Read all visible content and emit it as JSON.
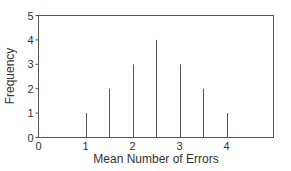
{
  "chart_data": {
    "type": "bar",
    "style": "spike/line bars",
    "title": "",
    "xlabel": "Mean Number of Errors",
    "ylabel": "Frequency",
    "x": [
      1,
      1.5,
      2,
      2.5,
      3,
      3.5,
      4
    ],
    "values": [
      1,
      2,
      3,
      4,
      3,
      2,
      1
    ],
    "xlim": [
      0,
      5
    ],
    "ylim": [
      0,
      5
    ],
    "xticks": [
      "0",
      "1",
      "2",
      "3",
      "4"
    ],
    "yticks": [
      "0",
      "1",
      "2",
      "3",
      "4",
      "5"
    ],
    "grid": false,
    "legend": null,
    "colors": {
      "bars": "#555555",
      "frame": "#555555",
      "text": "#333333"
    }
  }
}
